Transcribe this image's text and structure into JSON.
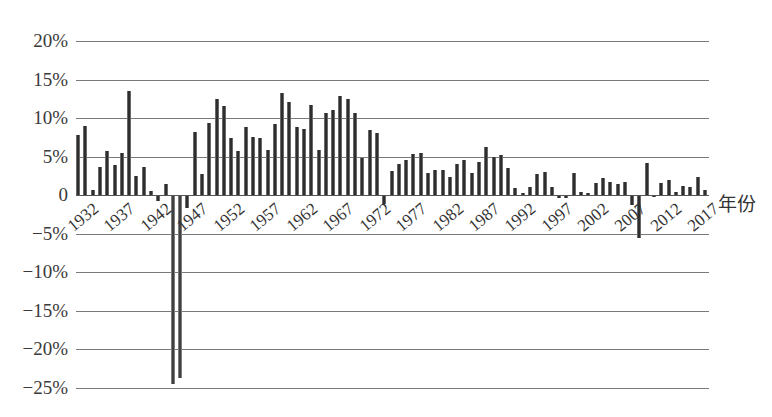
{
  "chart_data": {
    "type": "bar",
    "title": "",
    "xlabel": "年份",
    "ylabel": "",
    "ylim": [
      -25,
      20
    ],
    "grid": true,
    "legend": null,
    "y_ticks": [
      "20%",
      "15%",
      "10%",
      "5%",
      "0",
      "-5%",
      "-10%",
      "-15%",
      "-20%",
      "-25%"
    ],
    "y_tick_values": [
      20,
      15,
      10,
      5,
      0,
      -5,
      -10,
      -15,
      -20,
      -25
    ],
    "x_tick_labels": [
      "1932",
      "1937",
      "1942",
      "1947",
      "1952",
      "1957",
      "1962",
      "1967",
      "1972",
      "1977",
      "1982",
      "1987",
      "1992",
      "1997",
      "2002",
      "2007",
      "2012",
      "2017"
    ],
    "categories": [
      1932,
      1933,
      1934,
      1935,
      1936,
      1937,
      1938,
      1939,
      1940,
      1941,
      1942,
      1943,
      1944,
      1945,
      1946,
      1947,
      1948,
      1949,
      1950,
      1951,
      1952,
      1953,
      1954,
      1955,
      1956,
      1957,
      1958,
      1959,
      1960,
      1961,
      1962,
      1963,
      1964,
      1965,
      1966,
      1967,
      1968,
      1969,
      1970,
      1971,
      1972,
      1973,
      1974,
      1975,
      1976,
      1977,
      1978,
      1979,
      1980,
      1981,
      1982,
      1983,
      1984,
      1985,
      1986,
      1987,
      1988,
      1989,
      1990,
      1991,
      1992,
      1993,
      1994,
      1995,
      1996,
      1997,
      1998,
      1999,
      2000,
      2001,
      2002,
      2003,
      2004,
      2005,
      2006,
      2007,
      2008,
      2009,
      2010,
      2011,
      2012,
      2013,
      2014,
      2015,
      2016,
      2017,
      2018
    ],
    "values": [
      7.8,
      9.0,
      0.6,
      3.6,
      5.7,
      3.9,
      5.4,
      13.5,
      2.5,
      3.7,
      0.5,
      -0.6,
      1.4,
      -24.4,
      -23.6,
      -1.5,
      8.2,
      2.7,
      9.3,
      12.5,
      11.6,
      7.4,
      5.7,
      8.8,
      7.5,
      7.4,
      5.8,
      9.2,
      13.2,
      12.1,
      8.9,
      8.6,
      11.7,
      5.8,
      10.7,
      11.0,
      12.8,
      12.5,
      10.7,
      4.8,
      8.5,
      8.0,
      -1.0,
      3.1,
      4.0,
      4.5,
      5.3,
      5.5,
      2.8,
      3.2,
      3.2,
      2.4,
      4.0,
      4.5,
      2.9,
      4.3,
      6.3,
      5.0,
      5.2,
      3.5,
      0.9,
      0.3,
      1.0,
      2.7,
      3.0,
      1.1,
      -0.3,
      -0.3,
      2.8,
      0.4,
      0.3,
      1.5,
      2.2,
      1.7,
      1.4,
      1.7,
      -1.1,
      -5.4,
      4.2,
      -0.1,
      1.5,
      2.0,
      0.4,
      1.2,
      1.0,
      2.4,
      0.6
    ],
    "unit": "%"
  }
}
